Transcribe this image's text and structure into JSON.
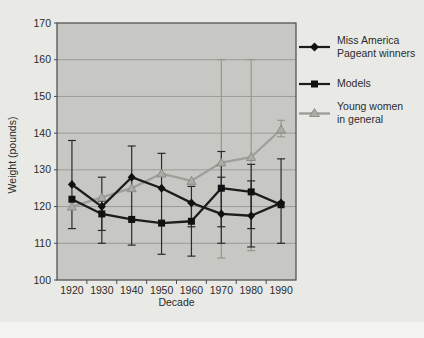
{
  "figure": {
    "background": "#e9eae6",
    "plot_background": "#c7c8c4",
    "gridline_color": "#9a9b97",
    "border_color": "#4a4a4a",
    "dark_series_color": "#1c1c1c",
    "gray_series_color": "#9e9e9a",
    "error_bar_dark_color": "#2b2b2b",
    "error_bar_gray_color": "#97978f"
  },
  "chart_data": {
    "type": "line",
    "title": "",
    "xlabel": "Decade",
    "ylabel": "Weight (pounds)",
    "ylim": [
      100,
      170
    ],
    "yticks": [
      100,
      110,
      120,
      130,
      140,
      150,
      160,
      170
    ],
    "categories": [
      "1920",
      "1930",
      "1940",
      "1950",
      "1960",
      "1970",
      "1980",
      "1990"
    ],
    "grid": "horizontal",
    "legend_position": "right",
    "series": [
      {
        "name": "Miss America Pageant winners",
        "marker": "diamond",
        "color": "#1c1c1c",
        "values": [
          126,
          120,
          128,
          125,
          121,
          118,
          117.5,
          121
        ]
      },
      {
        "name": "Models",
        "marker": "square",
        "color": "#1c1c1c",
        "values": [
          122,
          118,
          116.5,
          115.5,
          116,
          125,
          124,
          120.5
        ]
      },
      {
        "name": "Young women in general",
        "marker": "triangle",
        "color": "#9e9e9a",
        "values": [
          120,
          122.5,
          125,
          129,
          127,
          132,
          133.5,
          141
        ]
      }
    ],
    "error_bars": [
      {
        "category": "1920",
        "ranges": [
          {
            "lo": 114,
            "hi": 138,
            "tone": "dark"
          }
        ]
      },
      {
        "category": "1930",
        "ranges": [
          {
            "lo": 113.5,
            "hi": 128,
            "tone": "dark"
          },
          {
            "lo": 110,
            "hi": 121.5,
            "tone": "dark"
          }
        ]
      },
      {
        "category": "1940",
        "ranges": [
          {
            "lo": 109.5,
            "hi": 136.5,
            "tone": "dark"
          }
        ]
      },
      {
        "category": "1950",
        "ranges": [
          {
            "lo": 107,
            "hi": 134.5,
            "tone": "dark"
          }
        ]
      },
      {
        "category": "1960",
        "ranges": [
          {
            "lo": 114.5,
            "hi": 125.5,
            "tone": "dark"
          },
          {
            "lo": 106.5,
            "hi": 121,
            "tone": "dark"
          }
        ]
      },
      {
        "category": "1970",
        "ranges": [
          {
            "lo": 106,
            "hi": 160,
            "tone": "gray"
          },
          {
            "lo": 110,
            "hi": 135,
            "tone": "dark"
          },
          {
            "lo": 114.5,
            "hi": 128,
            "tone": "dark"
          }
        ]
      },
      {
        "category": "1980",
        "ranges": [
          {
            "lo": 108,
            "hi": 160,
            "tone": "gray"
          },
          {
            "lo": 109,
            "hi": 131.5,
            "tone": "dark"
          },
          {
            "lo": 114,
            "hi": 127,
            "tone": "dark"
          }
        ]
      },
      {
        "category": "1990",
        "ranges": [
          {
            "lo": 139,
            "hi": 143.5,
            "tone": "gray"
          },
          {
            "lo": 110,
            "hi": 133,
            "tone": "dark"
          }
        ]
      }
    ]
  },
  "legend": {
    "items": [
      {
        "label": "Miss America\nPageant winners"
      },
      {
        "label": "Models"
      },
      {
        "label": "Young women\nin general"
      }
    ]
  }
}
